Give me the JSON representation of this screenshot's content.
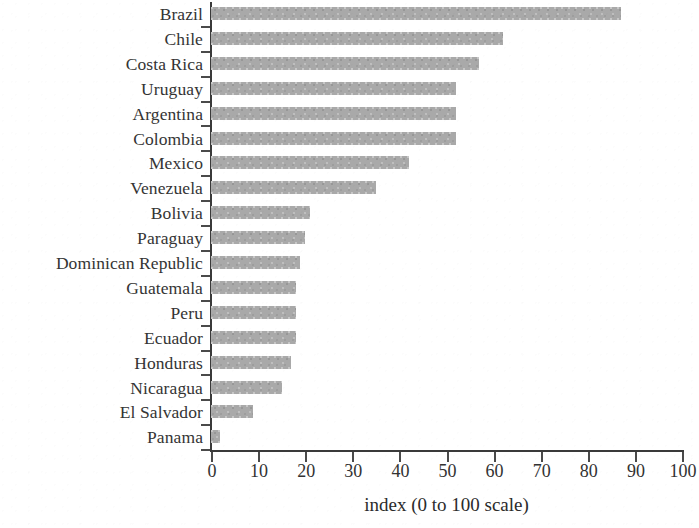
{
  "chart_data": {
    "type": "bar",
    "orientation": "horizontal",
    "title": "",
    "subtitle": "",
    "xlabel": "index (0 to 100 scale)",
    "ylabel": "",
    "xlim": [
      0,
      100
    ],
    "xticks": [
      0,
      10,
      20,
      30,
      40,
      50,
      60,
      70,
      80,
      90,
      100
    ],
    "xtick_labels": [
      "0",
      "10",
      "20",
      "30",
      "40",
      "50",
      "60",
      "70",
      "80",
      "90",
      "100"
    ],
    "grid": false,
    "legend": null,
    "bar_color": "#a9a9a9",
    "axis_color": "#3a3a3a",
    "categories": [
      "Brazil",
      "Chile",
      "Costa Rica",
      "Uruguay",
      "Argentina",
      "Colombia",
      "Mexico",
      "Venezuela",
      "Bolivia",
      "Paraguay",
      "Dominican Republic",
      "Guatemala",
      "Peru",
      "Ecuador",
      "Honduras",
      "Nicaragua",
      "El Salvador",
      "Panama"
    ],
    "values": [
      87,
      62,
      57,
      52,
      52,
      52,
      42,
      35,
      21,
      20,
      19,
      18,
      18,
      18,
      17,
      15,
      9,
      2
    ]
  }
}
